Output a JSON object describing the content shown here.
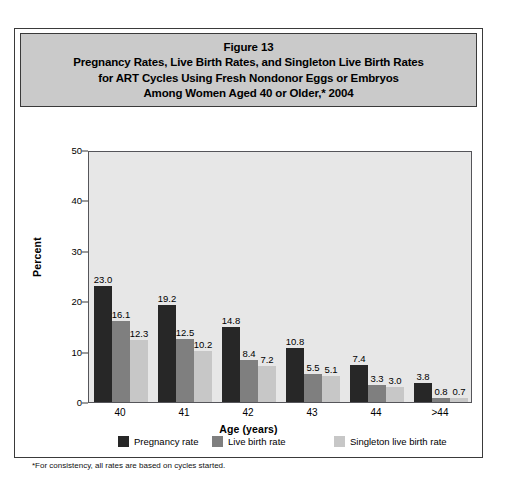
{
  "figure": {
    "title_lines": [
      "Figure 13",
      "Pregnancy Rates, Live Birth Rates, and Singleton Live Birth Rates",
      "for ART Cycles Using Fresh Nondonor Eggs or Embryos",
      "Among Women Aged 40 or Older,* 2004"
    ],
    "footnote": "*For consistency, all rates are based on cycles started."
  },
  "colors": {
    "series_0": "#272727",
    "series_1": "#7f7f7f",
    "series_2": "#c7c7c7",
    "title_band": "#cacaca",
    "plot_background": "#e7e7e7",
    "frame": "#55555a"
  },
  "chart_data": {
    "type": "bar",
    "title": "Pregnancy Rates, Live Birth Rates, and Singleton Live Birth Rates for ART Cycles Using Fresh Nondonor Eggs or Embryos Among Women Aged 40 or Older,* 2004",
    "xlabel": "Age (years)",
    "ylabel": "Percent",
    "categories": [
      "40",
      "41",
      "42",
      "43",
      "44",
      ">44"
    ],
    "series": [
      {
        "name": "Pregnancy rate",
        "values": [
          23.0,
          19.2,
          14.8,
          10.8,
          7.4,
          3.8
        ]
      },
      {
        "name": "Live birth rate",
        "values": [
          16.1,
          12.5,
          8.4,
          5.5,
          3.3,
          0.8
        ]
      },
      {
        "name": "Singleton live birth rate",
        "values": [
          12.3,
          10.2,
          7.2,
          5.1,
          3.0,
          0.7
        ]
      }
    ],
    "value_labels": [
      [
        "23.0",
        "16.1",
        "12.3"
      ],
      [
        "19.2",
        "12.5",
        "10.2"
      ],
      [
        "14.8",
        "8.4",
        "7.2"
      ],
      [
        "10.8",
        "5.5",
        "5.1"
      ],
      [
        "7.4",
        "3.3",
        "3.0"
      ],
      [
        "3.8",
        "0.8",
        "0.7"
      ]
    ],
    "ylim": [
      0,
      50
    ],
    "yticks": [
      "0",
      "10",
      "20",
      "30",
      "40",
      "50"
    ],
    "grid": false,
    "legend_position": "bottom"
  }
}
